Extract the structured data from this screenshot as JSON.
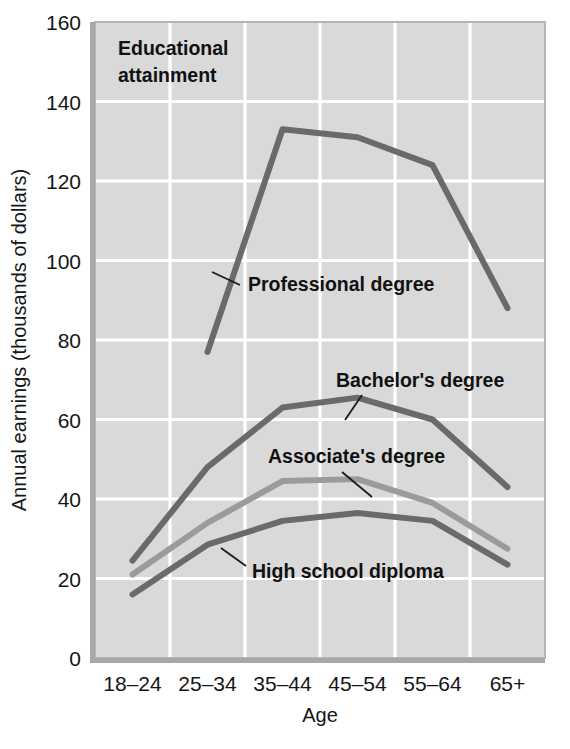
{
  "figure": {
    "panel_title_line1": "Educational",
    "panel_title_line2": "attainment",
    "background_color": "#d9d9d9",
    "gridline_color": "#ffffff",
    "frame_color": "#9a9a9a",
    "page_background": "#ffffff"
  },
  "chart_data": {
    "type": "line",
    "title": "Educational attainment",
    "xlabel": "Age",
    "ylabel": "Annual earnings (thousands of dollars)",
    "categories": [
      "18–24",
      "25–34",
      "35–44",
      "45–54",
      "55–64",
      "65+"
    ],
    "x": [
      "18-24",
      "25-34",
      "35-44",
      "45-54",
      "55-64",
      "65+"
    ],
    "ylim": [
      0,
      160
    ],
    "yticks": [
      0,
      20,
      40,
      60,
      80,
      100,
      120,
      140,
      160
    ],
    "ytick_labels": [
      "0",
      "20",
      "40",
      "60",
      "80",
      "100",
      "120",
      "140",
      "160"
    ],
    "grid": true,
    "legend": "inline-annotations",
    "units": "thousands of dollars",
    "series": [
      {
        "name": "Professional degree",
        "color": "#6a6a6a",
        "values": [
          null,
          77,
          133,
          131,
          124,
          88
        ],
        "label_x": 248,
        "label_y": 291,
        "leader_from": [
          212,
          272
        ],
        "leader_to": [
          240,
          285
        ]
      },
      {
        "name": "Bachelor's degree",
        "color": "#6a6a6a",
        "values": [
          24.5,
          48,
          63,
          65.5,
          60,
          43
        ],
        "label_x": 336,
        "label_y": 387,
        "leader_from": [
          345,
          420
        ],
        "leader_to": [
          362,
          395
        ]
      },
      {
        "name": "Associate's degree",
        "color": "#9b9b9b",
        "values": [
          21,
          34,
          44.5,
          45,
          39,
          27.5
        ],
        "label_x": 268,
        "label_y": 463,
        "leader_from": [
          372,
          497
        ],
        "leader_to": [
          342,
          472
        ]
      },
      {
        "name": "High school diploma",
        "color": "#6a6a6a",
        "values": [
          16,
          28.5,
          34.5,
          36.5,
          34.5,
          23.5
        ],
        "label_x": 252,
        "label_y": 578,
        "leader_from": [
          221,
          548
        ],
        "leader_to": [
          246,
          566
        ]
      }
    ]
  }
}
